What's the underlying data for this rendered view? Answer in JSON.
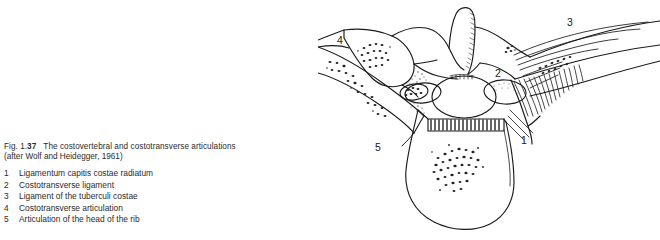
{
  "figure": {
    "number_prefix": "Fig. 1.",
    "number_bold": "37",
    "title": "The costovertebral and costotransverse articulations",
    "source": "(after Wolf and Heidegger, 1961)"
  },
  "legend": {
    "items": [
      {
        "num": "1",
        "text": "Ligamentum capitis costae radiatum"
      },
      {
        "num": "2",
        "text": "Costotransverse ligament"
      },
      {
        "num": "3",
        "text": "Ligament of the tuberculi costae"
      },
      {
        "num": "4",
        "text": "Costotransverse articulation"
      },
      {
        "num": "5",
        "text": "Articulation of the head of the rib"
      }
    ]
  },
  "illustration": {
    "alt_name": "thoracic-vertebra-superior-view",
    "callouts": [
      {
        "id": "1",
        "label": "1",
        "x": 206,
        "y": 144
      },
      {
        "id": "2",
        "label": "2",
        "x": 180,
        "y": 77
      },
      {
        "id": "3",
        "label": "3",
        "x": 252,
        "y": 26
      },
      {
        "id": "4",
        "label": "4",
        "x": 22,
        "y": 44
      },
      {
        "id": "5",
        "label": "5",
        "x": 60,
        "y": 151
      }
    ],
    "colors": {
      "ink": "#1a1a1a",
      "paper": "#ffffff",
      "stipple": "#2a2a2a"
    }
  }
}
